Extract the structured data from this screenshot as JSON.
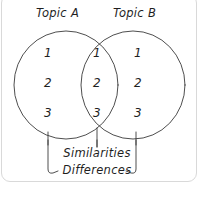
{
  "diagram": {
    "type": "venn-diagram",
    "title_left": "Topic A",
    "title_right": "Topic B",
    "left_only_items": [
      "1",
      "2",
      "3"
    ],
    "overlap_items": [
      "1",
      "2",
      "3"
    ],
    "right_only_items": [
      "1",
      "2",
      "3"
    ],
    "bracket_labels": {
      "center": "Similarities",
      "outer": "Differences"
    },
    "colors": {
      "stroke": "#3a3a3a",
      "text": "#1f1f1f",
      "frame": "#d9d9d9",
      "background": "#ffffff"
    }
  }
}
